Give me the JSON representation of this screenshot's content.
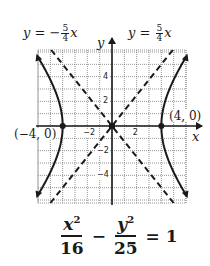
{
  "graph": {
    "x_range": [
      -6,
      6
    ],
    "y_range": [
      -6,
      6
    ],
    "grid_step": 1,
    "axis_x_label": "x",
    "axis_y_label": "y",
    "x_tick_labels": [
      {
        "value": -2,
        "text": "−2"
      },
      {
        "value": 2,
        "text": "2"
      }
    ],
    "y_tick_labels": [
      {
        "value": 4,
        "text": "4"
      },
      {
        "value": 2,
        "text": "2"
      },
      {
        "value": -2,
        "text": "−2"
      },
      {
        "value": -4,
        "text": "−4"
      }
    ],
    "a": 4,
    "b": 5,
    "curve_color": "#1a1a1a",
    "grid_color": "#7a7a7a"
  },
  "asymptotes": {
    "negative": {
      "prefix": "y = −",
      "num": "5",
      "den": "4",
      "suffix": "x"
    },
    "positive": {
      "prefix": "y = ",
      "num": "5",
      "den": "4",
      "suffix": "x"
    }
  },
  "vertices": {
    "left": "(−4, 0)",
    "right": "(4, 0)"
  },
  "equation": {
    "x_num": "x",
    "x_exp": "2",
    "x_den": "16",
    "minus": "−",
    "y_num": "y",
    "y_exp": "2",
    "y_den": "25",
    "equals": "= 1"
  }
}
